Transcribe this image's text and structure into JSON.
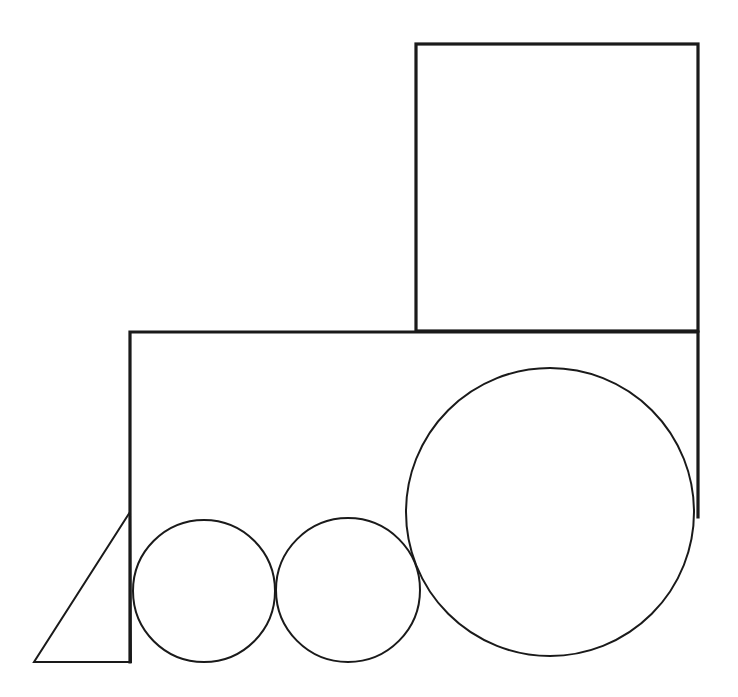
{
  "diagram": {
    "background": "#ffffff",
    "stroke_color": "#1a1a1a",
    "shapes": {
      "cab": {
        "type": "rectangle",
        "x": 416,
        "y": 44,
        "width": 282,
        "height": 287
      },
      "boiler_outline": {
        "type": "polyline",
        "points": [
          [
            130,
            662
          ],
          [
            130,
            332
          ],
          [
            698,
            332
          ],
          [
            698,
            517
          ]
        ]
      },
      "cowcatcher": {
        "type": "triangle",
        "points": [
          [
            130,
            512
          ],
          [
            34,
            662
          ],
          [
            131,
            662
          ]
        ]
      },
      "small_wheel_front": {
        "type": "circle",
        "cx": 204,
        "cy": 591,
        "r": 71
      },
      "small_wheel_middle": {
        "type": "circle",
        "cx": 348,
        "cy": 590,
        "r": 72
      },
      "large_wheel_rear": {
        "type": "circle",
        "cx": 550,
        "cy": 512,
        "r": 144
      }
    }
  }
}
